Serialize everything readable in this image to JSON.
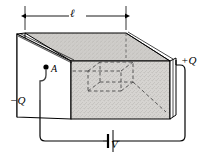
{
  "figure": {
    "dimension_label": "ℓ",
    "positive_plate_label": "+Q",
    "negative_plate_label": "−Q",
    "point_label": "A",
    "battery_label": "V",
    "colors": {
      "line": "#000000",
      "dielectric_fill": "#d4d2cf",
      "top_face_fill": "#cfcdca",
      "plate_fill": "#ffffff",
      "dashed_line": "#4a4a4a",
      "background": "#ffffff"
    },
    "elements": {
      "dimension_line": "horizontal double-headed arrow spanning the top of the slab",
      "slab": "3D rectangular dielectric block, stippled gray",
      "inner_cube": "dashed gaussian cube inside the dielectric",
      "circuit": "wire loop from left plate down and around to right plate through a battery"
    }
  }
}
